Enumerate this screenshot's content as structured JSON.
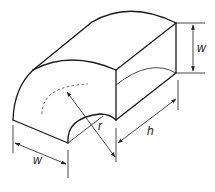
{
  "figure": {
    "labels": {
      "width_front": "w",
      "width_right": "w",
      "length": "h",
      "radius": "r"
    },
    "colors": {
      "line": "#1a1a1a",
      "background": "#ffffff"
    }
  }
}
